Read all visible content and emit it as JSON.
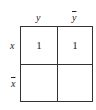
{
  "kmap": {
    "col_labels": [
      "y",
      "y"
    ],
    "col_label_negated": [
      false,
      true
    ],
    "row_labels": [
      "x",
      "x"
    ],
    "row_label_negated": [
      false,
      true
    ],
    "cells": [
      [
        "1",
        "1"
      ],
      [
        "",
        ""
      ]
    ]
  }
}
